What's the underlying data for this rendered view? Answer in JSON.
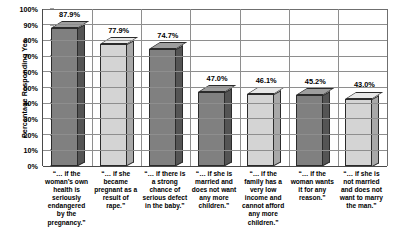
{
  "chart_data": {
    "type": "bar",
    "title": "",
    "xlabel": "",
    "ylabel": "Percentage Responding Yes",
    "ylim": [
      0,
      100
    ],
    "grid": true,
    "legend": "none",
    "ytick_labels": [
      "100%",
      "90%",
      "80%",
      "70%",
      "60%",
      "50%",
      "40%",
      "30%",
      "20%",
      "10%",
      "0%"
    ],
    "ytick_values": [
      100,
      90,
      80,
      70,
      60,
      50,
      40,
      30,
      20,
      10,
      0
    ],
    "categories": [
      "“… if the woman’s own health is seriously endangered by the pregnancy.”",
      "“… if she became pregnant as a result of rape.”",
      "“… if there is a strong chance of serious defect in the baby.”",
      "“… if she is married and does not want any more children.”",
      "“… if the family has a very low income and cannot afford any more children.”",
      "“… if the woman wants it for any reason.”",
      "“… if she is not married and does not want to marry the man.”"
    ],
    "values": [
      87.9,
      77.9,
      74.7,
      47.0,
      46.1,
      45.2,
      43.0
    ],
    "value_labels": [
      "87.9%",
      "77.9%",
      "74.7%",
      "47.0%",
      "46.1%",
      "45.2%",
      "43.0%"
    ],
    "bar_shades": [
      "dark",
      "light",
      "dark",
      "dark",
      "light",
      "dark",
      "light"
    ],
    "colors": {
      "bar_dark_front": "#808080",
      "bar_dark_side": "#545454",
      "bar_dark_top": "#9e9e9e",
      "bar_light_front": "#d4d4d4",
      "bar_light_side": "#a8a8a8",
      "bar_light_top": "#e8e8e8",
      "gridline": "#8e8e8e",
      "axis": "#4a4a4a",
      "text": "#000000",
      "background": "#ffffff"
    }
  }
}
